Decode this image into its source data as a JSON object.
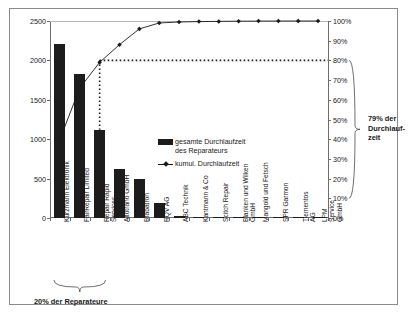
{
  "chart_data": {
    "type": "bar",
    "title": "",
    "subtitle": "",
    "xlabel": "",
    "ylabel": "",
    "grid": false,
    "legend_position": "inside-right",
    "categories": [
      "Kurzmann Elektronik",
      "FairRepair Limited",
      "Repair Rapid\nServices",
      "Altotrano GmbH",
      "Brabatron",
      "RQV AG",
      "ABC Technik",
      "Kantmann & Co",
      "Scitch Repair",
      "Blanken und Wilken\nGmbH",
      "Mangold und Fetsch",
      "SPR Garmon",
      "Tiementos AG",
      "LPM Service GmbH"
    ],
    "series": [
      {
        "name": "gesamte Durchlaufzeit des Reparateurs",
        "type": "bar",
        "axis": "left",
        "values": [
          2210,
          1830,
          1120,
          620,
          500,
          185,
          20,
          18,
          10,
          6,
          5,
          3,
          3,
          2
        ]
      },
      {
        "name": "kumul. Durchlaufzeit",
        "type": "line",
        "axis": "right",
        "values": [
          40,
          66,
          79,
          88,
          96,
          99,
          99.5,
          99.7,
          99.8,
          99.9,
          99.95,
          99.97,
          99.99,
          100
        ]
      }
    ],
    "ylim": [
      0,
      2500
    ],
    "yticks": [
      0,
      500,
      1000,
      1500,
      2000,
      2500
    ],
    "ylim_right": [
      0,
      100
    ],
    "yticks_right": [
      "0%",
      "10%",
      "20%",
      "30%",
      "40%",
      "50%",
      "60%",
      "70%",
      "80%",
      "90%",
      "100%"
    ],
    "reference_line": {
      "value": 80,
      "label": "80%",
      "style": "dotted"
    },
    "annotations": [
      {
        "name": "bottom-bracket",
        "text": "20% der Reparateure",
        "covers_categories": 3
      },
      {
        "name": "right-bracket",
        "text": "79% der\nDurchlauf-\nzeit",
        "value": 79
      }
    ]
  },
  "legend": {
    "items": [
      {
        "label": "gesamte Durchlaufzeit\ndes Reparateurs",
        "marker": "bar-swatch"
      },
      {
        "label": "kumul. Durchlaufzeit",
        "marker": "line-marker"
      }
    ]
  },
  "axes": {
    "left_ticks": [
      "2500",
      "2000",
      "1500",
      "1000",
      "500",
      "0"
    ],
    "right_ticks": [
      "100%",
      "90%",
      "80%",
      "70%",
      "60%",
      "50%",
      "40%",
      "30%",
      "20%",
      "10%",
      "0%"
    ]
  },
  "annotations": {
    "bottom": "20% der Reparateure",
    "right": "79% der\nDurchlauf-\nzeit"
  },
  "colors": {
    "bar": "#1c1c1c",
    "line": "#1a1a1a",
    "axis": "#6e6e6e",
    "frame": "#8a8a8a",
    "background": "#ffffff"
  }
}
